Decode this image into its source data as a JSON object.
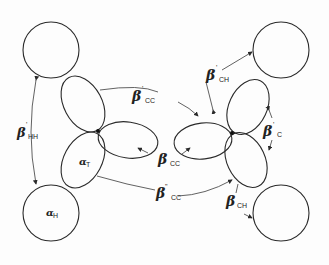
{
  "diagram": {
    "type": "orbital-interaction-diagram",
    "colors": {
      "line": "#2a2a2a",
      "text": "#222222",
      "background": "#fdfdfd"
    },
    "labels": {
      "beta_hh_prime": {
        "symbol": "β",
        "prime": "'",
        "subscript": "HH"
      },
      "beta_cc_prime": {
        "symbol": "β",
        "prime": "'",
        "subscript": "CC"
      },
      "beta_ch_prime": {
        "symbol": "β",
        "prime": "'",
        "subscript": "CH"
      },
      "beta_c_prime": {
        "symbol": "β",
        "prime": "'",
        "subscript": "C"
      },
      "beta_cc": {
        "symbol": "β",
        "prime": "",
        "subscript": "CC"
      },
      "beta_cc_double": {
        "symbol": "β",
        "prime": "\"",
        "subscript": "CC"
      },
      "beta_ch": {
        "symbol": "β",
        "prime": "",
        "subscript": "CH"
      },
      "alpha_t": {
        "symbol": "α",
        "subscript": "T"
      },
      "alpha_h": {
        "symbol": "α",
        "subscript": "H"
      }
    },
    "nodes": [
      {
        "id": "H1",
        "kind": "hydrogen-1s",
        "position": "top-left"
      },
      {
        "id": "H2",
        "kind": "hydrogen-1s",
        "position": "bottom-left"
      },
      {
        "id": "H3",
        "kind": "hydrogen-1s",
        "position": "top-right"
      },
      {
        "id": "H4",
        "kind": "hydrogen-1s",
        "position": "bottom-right"
      },
      {
        "id": "C1",
        "kind": "carbon-sp2-hybrids",
        "position": "center-left"
      },
      {
        "id": "C2",
        "kind": "carbon-sp2-hybrids",
        "position": "center-right"
      }
    ]
  }
}
